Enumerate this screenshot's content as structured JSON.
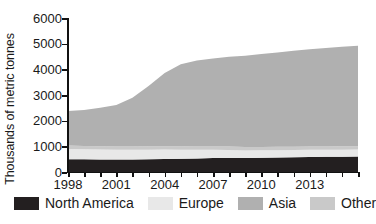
{
  "chart_data": {
    "type": "area",
    "stacked": true,
    "title": "",
    "subtitle": "",
    "xlabel": "",
    "ylabel": "Thousands of metric tonnes",
    "xlim": [
      1998,
      2016
    ],
    "ylim": [
      0,
      6000
    ],
    "grid": false,
    "legend_position": "bottom",
    "y_ticks": [
      0,
      1000,
      2000,
      3000,
      4000,
      5000,
      6000
    ],
    "y_tick_labels": [
      "0",
      "1000",
      "2000",
      "3000",
      "4000",
      "5000",
      "6000"
    ],
    "x_ticks": [
      1998,
      1999,
      2000,
      2001,
      2002,
      2003,
      2004,
      2005,
      2006,
      2007,
      2008,
      2009,
      2010,
      2011,
      2012,
      2013,
      2014,
      2015,
      2016
    ],
    "x_tick_labels": [
      "1998",
      "",
      "",
      "2001",
      "",
      "",
      "2004",
      "",
      "",
      "2007",
      "",
      "",
      "2010",
      "",
      "",
      "2013",
      "",
      "",
      ""
    ],
    "x": [
      1998,
      1999,
      2000,
      2001,
      2002,
      2003,
      2004,
      2005,
      2006,
      2007,
      2008,
      2009,
      2010,
      2011,
      2012,
      2013,
      2014,
      2015,
      2016
    ],
    "series": [
      {
        "name": "North America",
        "color": "#231f20",
        "values": [
          500,
          495,
          490,
          485,
          490,
          500,
          510,
          520,
          530,
          545,
          550,
          545,
          555,
          565,
          575,
          585,
          590,
          595,
          600
        ]
      },
      {
        "name": "Europe",
        "color": "#e8e8e8",
        "values": [
          400,
          390,
          385,
          380,
          375,
          370,
          365,
          350,
          335,
          320,
          310,
          295,
          290,
          285,
          280,
          280,
          275,
          275,
          275
        ]
      },
      {
        "name": "Asia",
        "color": "#b0b0b0",
        "values": [
          1350,
          1400,
          1500,
          1620,
          1900,
          2350,
          2850,
          3200,
          3350,
          3430,
          3500,
          3560,
          3620,
          3680,
          3740,
          3790,
          3840,
          3880,
          3910
        ]
      },
      {
        "name": "Other",
        "color": "#c9c9c9",
        "values": [
          130,
          130,
          130,
          130,
          130,
          130,
          130,
          130,
          130,
          130,
          130,
          130,
          130,
          130,
          130,
          130,
          130,
          130,
          130
        ]
      }
    ],
    "stack_order": [
      "North America",
      "Europe",
      "Other",
      "Asia"
    ],
    "totals": [
      2380,
      2415,
      2505,
      2615,
      2895,
      3350,
      3855,
      4200,
      4345,
      4425,
      4490,
      4530,
      4595,
      4660,
      4725,
      4785,
      4835,
      4880,
      4915
    ]
  },
  "legend": {
    "items": [
      {
        "label": "North America",
        "color": "#231f20"
      },
      {
        "label": "Europe",
        "color": "#e8e8e8"
      },
      {
        "label": "Asia",
        "color": "#b0b0b0"
      },
      {
        "label": "Other",
        "color": "#c9c9c9"
      }
    ]
  },
  "axes": {
    "y_title": "Thousands of metric tonnes"
  }
}
